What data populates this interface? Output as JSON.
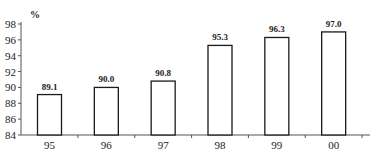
{
  "chart_data": {
    "type": "bar",
    "title": "",
    "xlabel": "",
    "ylabel": "%",
    "categories": [
      "95",
      "96",
      "97",
      "98",
      "99",
      "00"
    ],
    "values": [
      89.1,
      90.0,
      90.8,
      95.3,
      96.3,
      97.0
    ],
    "value_labels": [
      "89.1",
      "90.0",
      "90.8",
      "95.3",
      "96.3",
      "97.0"
    ],
    "ylim": [
      84,
      98
    ],
    "yticks": [
      84,
      86,
      88,
      90,
      92,
      94,
      96,
      98
    ],
    "grid": false,
    "legend": null,
    "bar_fill": "#ffffff",
    "bar_stroke": "#1a1a1a",
    "axis_color": "#555555"
  }
}
